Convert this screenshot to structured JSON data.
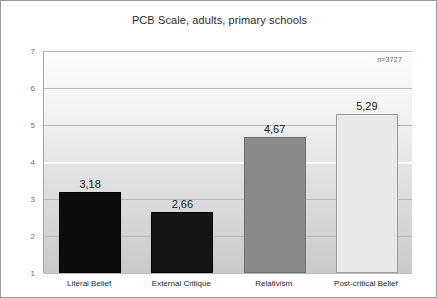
{
  "chart_data": {
    "type": "bar",
    "title": "PCB Scale, adults, primary schools",
    "xlabel": "",
    "ylabel": "",
    "categories": [
      "Literal Belief",
      "External Critique",
      "Relativism",
      "Post-critical Belief"
    ],
    "values": [
      3.18,
      2.66,
      4.67,
      5.29
    ],
    "value_labels": [
      "3,18",
      "2,66",
      "4,67",
      "5,29"
    ],
    "bar_colors": [
      "#0d0d0d",
      "#141414",
      "#8a8a8a",
      "#e8e8e8"
    ],
    "ylim": [
      1,
      7
    ],
    "yticks": [
      1,
      2,
      3,
      4,
      5,
      6,
      7
    ],
    "ytick_labels": [
      "1",
      "2",
      "3",
      "4",
      "5",
      "6",
      "7"
    ],
    "grid": true,
    "legend": "none",
    "annotations": [
      {
        "name": "sample-size",
        "text": "n=3727"
      }
    ]
  }
}
